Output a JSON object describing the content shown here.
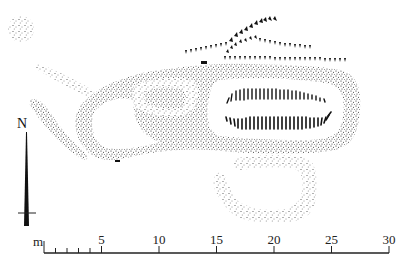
{
  "diagram": {
    "type": "archaeological site plan",
    "style": "stippled earthworks with hachured scarps",
    "colors": {
      "background": "#ffffff",
      "ink": "#1a1a1a"
    }
  },
  "north_arrow": {
    "label": "N"
  },
  "scale_bar": {
    "unit_label": "m",
    "ticks": [
      "5",
      "10",
      "15",
      "20",
      "25",
      "30"
    ],
    "minor_ticks_first_segment": 4,
    "range": [
      0,
      30
    ]
  },
  "features": [
    {
      "id": "mound",
      "description": "small circular stippled mound, top-left"
    },
    {
      "id": "main-bank",
      "description": "long elongated stippled bank enclosure"
    },
    {
      "id": "inner-enclosure",
      "description": "small oval stippled enclosure at west end"
    },
    {
      "id": "spur",
      "description": "tapering stippled spur to the west"
    },
    {
      "id": "hachured-hollow",
      "description": "elongated hachured hollow within main bank"
    },
    {
      "id": "scarps-north",
      "description": "hachured scarp lines north of main bank"
    },
    {
      "id": "south-enclosure",
      "description": "U-shaped stippled bank south of main bank"
    }
  ]
}
